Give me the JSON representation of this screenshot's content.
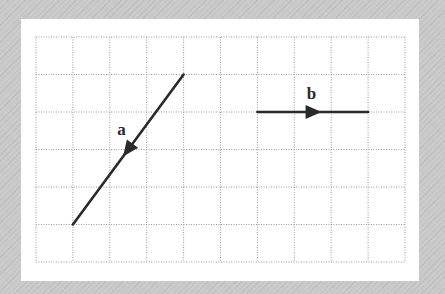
{
  "diagram": {
    "type": "vector-grid",
    "grid": {
      "columns": 10,
      "rows": 6,
      "line_style": "dotted",
      "line_color": "#9a9a9a",
      "origin_px": [
        36,
        37
      ],
      "cell_w_px": 36.9,
      "cell_h_px": 37.5
    },
    "colors": {
      "background": "#c9c9c9",
      "panel": "#ffffff",
      "vector": "#2a2a2a"
    },
    "vectors": [
      {
        "label": "a",
        "start_grid": [
          4,
          1
        ],
        "end_grid": [
          1,
          5
        ],
        "components": [
          -3,
          -4
        ],
        "arrow_position": "midpoint",
        "direction": "down-left"
      },
      {
        "label": "b",
        "start_grid": [
          6,
          2
        ],
        "end_grid": [
          9,
          2
        ],
        "components": [
          3,
          0
        ],
        "arrow_position": "midpoint",
        "direction": "right"
      }
    ]
  }
}
